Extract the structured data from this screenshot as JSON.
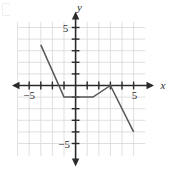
{
  "figure": {
    "kind": "coordinate-plane-graph",
    "background_color": "#ffffff",
    "grid_color": "#d8d8dc",
    "axis_color": "#2b2b2b",
    "curve_color": "#555555"
  },
  "axes": {
    "x_label": "x",
    "y_label": "y",
    "x_tick_label_negative": "−5",
    "x_tick_label_positive": "5",
    "y_tick_label_positive": "5",
    "y_tick_label_negative": "−5"
  },
  "chart_data": {
    "type": "line",
    "title": "",
    "xlabel": "x",
    "ylabel": "y",
    "xlim": [
      -6,
      6
    ],
    "ylim": [
      -6,
      6
    ],
    "grid": true,
    "legend": "none",
    "xticks": [
      -5,
      5
    ],
    "xticklabels": [
      "−5",
      "5"
    ],
    "yticks": [
      5,
      -5
    ],
    "yticklabels": [
      "5",
      "−5"
    ],
    "series": [
      {
        "name": "piecewise function",
        "kind": "piecewise-linear",
        "x": [
          -3,
          -1,
          1.5,
          3,
          5
        ],
        "y": [
          3.5,
          -1,
          -1,
          0,
          -4
        ],
        "points": [
          {
            "x": -3,
            "y": 3.5,
            "role": "start-endpoint"
          },
          {
            "x": -1,
            "y": -1,
            "role": "vertex"
          },
          {
            "x": 1.5,
            "y": -1,
            "role": "vertex"
          },
          {
            "x": 3,
            "y": 0,
            "role": "peak-vertex"
          },
          {
            "x": 5,
            "y": -4,
            "role": "end-endpoint"
          }
        ],
        "x_intercepts": [
          -1.36,
          3
        ],
        "segments": [
          {
            "from": [
              -3,
              3.5
            ],
            "to": [
              -1,
              -1
            ],
            "slope": -2.25,
            "description": "steep decreasing"
          },
          {
            "from": [
              -1,
              -1
            ],
            "to": [
              1.5,
              -1
            ],
            "slope": 0,
            "description": "horizontal at y = -1"
          },
          {
            "from": [
              1.5,
              -1
            ],
            "to": [
              3,
              0
            ],
            "slope": 0.667,
            "description": "increasing to x-axis"
          },
          {
            "from": [
              3,
              0
            ],
            "to": [
              5,
              -4
            ],
            "slope": -2,
            "description": "decreasing"
          }
        ]
      }
    ]
  }
}
